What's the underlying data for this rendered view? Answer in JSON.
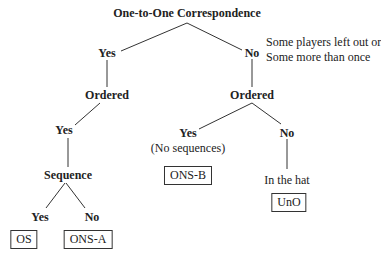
{
  "diagram": {
    "root": "One-to-One Correspondence",
    "root_yes": "Yes",
    "root_no": "No",
    "no_note_line1": "Some players left out or",
    "no_note_line2": "Some more than once",
    "left_ordered": "Ordered",
    "right_ordered": "Ordered",
    "left_ordered_yes": "Yes",
    "right_ordered_yes": "Yes",
    "right_ordered_yes_note": "(No sequences)",
    "right_ordered_no": "No",
    "right_ordered_no_note": "In the hat",
    "sequence": "Sequence",
    "sequence_yes": "Yes",
    "sequence_no": "No",
    "outcomes": {
      "os": "OS",
      "ons_a": "ONS-A",
      "ons_b": "ONS-B",
      "uno": "UnO"
    }
  }
}
